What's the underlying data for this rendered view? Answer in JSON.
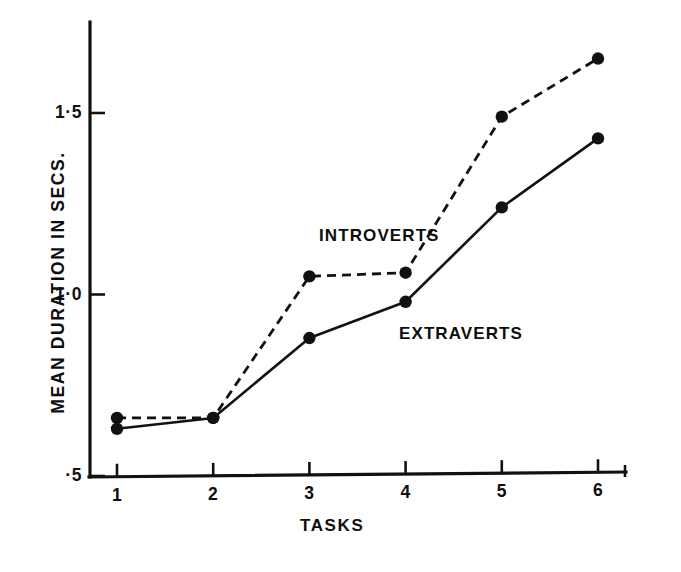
{
  "figure": {
    "background_color": "#ffffff",
    "ink_color": "#111111"
  },
  "axes": {
    "y_title": "MEAN DURATION IN SECS.",
    "x_title": "TASKS",
    "y_tick_labels": [
      "1·5",
      "1·0",
      "·5"
    ],
    "y_tick_values": [
      1.5,
      1.0,
      0.5
    ],
    "x_tick_labels": [
      "1",
      "2",
      "3",
      "4",
      "5",
      "6"
    ]
  },
  "series_labels": {
    "introverts": "INTROVERTS",
    "extraverts": "EXTRAVERTS"
  },
  "chart_data": {
    "type": "line",
    "title": "",
    "subtitle": "",
    "xlabel": "TASKS",
    "ylabel": "MEAN DURATION IN SECS.",
    "categories": [
      "1",
      "2",
      "3",
      "4",
      "5",
      "6"
    ],
    "x": [
      1,
      2,
      3,
      4,
      5,
      6
    ],
    "xlim": [
      0.72,
      6.28
    ],
    "ylim": [
      0.5,
      1.72
    ],
    "ytick_values": [
      0.5,
      1.0,
      1.5
    ],
    "ytick_labels": [
      "·5",
      "1·0",
      "1·5"
    ],
    "grid": false,
    "legend": "inline-annotations",
    "legend_position": "inline",
    "series": [
      {
        "name": "INTROVERTS",
        "line_style": "dashed",
        "marker": "filled-circle",
        "color": "#111111",
        "values": [
          0.66,
          0.66,
          1.05,
          1.06,
          1.49,
          1.65
        ]
      },
      {
        "name": "EXTRAVERTS",
        "line_style": "solid",
        "marker": "filled-circle",
        "color": "#111111",
        "values": [
          0.63,
          0.66,
          0.88,
          0.98,
          1.24,
          1.43
        ]
      }
    ],
    "annotations": [
      {
        "text": "INTROVERTS",
        "x": 3.6,
        "y": 1.19
      },
      {
        "text": "EXTRAVERTS",
        "x": 4.4,
        "y": 0.92
      }
    ]
  }
}
